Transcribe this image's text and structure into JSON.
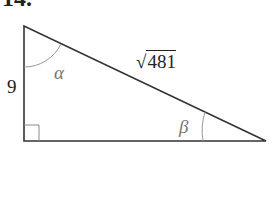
{
  "problem": {
    "number": "14."
  },
  "triangle": {
    "vertical_side": "9",
    "hypotenuse_radical_sign": "√",
    "hypotenuse_radicand": "481",
    "angle_top": "α",
    "angle_right": "β",
    "right_angle_marker": "bottom-left"
  },
  "colors": {
    "lines": "#333333",
    "angle_arcs": "#999999",
    "angle_labels": "#777777"
  }
}
